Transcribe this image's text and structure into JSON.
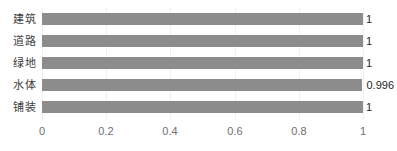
{
  "chart_data": {
    "type": "bar",
    "orientation": "horizontal",
    "title": "",
    "subtitle": "",
    "xlabel": "",
    "ylabel": "",
    "categories": [
      "建筑",
      "道路",
      "绿地",
      "水体",
      "铺装"
    ],
    "values": [
      1,
      1,
      1,
      0.996,
      1
    ],
    "value_labels": [
      "1",
      "1",
      "1",
      "0.996",
      "1"
    ],
    "xlim": [
      0,
      1
    ],
    "xticks": [
      0,
      0.2,
      0.4,
      0.6,
      0.8,
      1
    ],
    "xtick_labels": [
      "0",
      "0.2",
      "0.4",
      "0.6",
      "0.8",
      "1"
    ],
    "grid": "vertical",
    "legend": "none",
    "bar_color": "#8c8c8c",
    "gridline_color": "#f0f0f0",
    "category_label_color": "#3d3d3d",
    "value_label_color": "#262626",
    "tick_label_color": "#6e6e6e",
    "background_color": "#ffffff"
  }
}
